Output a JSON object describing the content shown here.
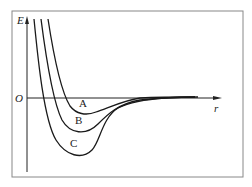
{
  "diagram": {
    "type": "potential-energy-curves",
    "y_axis_label": "E",
    "x_axis_label": "r",
    "origin_label": "O",
    "curves": [
      {
        "label": "A"
      },
      {
        "label": "B"
      },
      {
        "label": "C"
      }
    ],
    "colors": {
      "frame": "#888888",
      "curve": "#1a1a1a",
      "axis": "#222222"
    }
  }
}
